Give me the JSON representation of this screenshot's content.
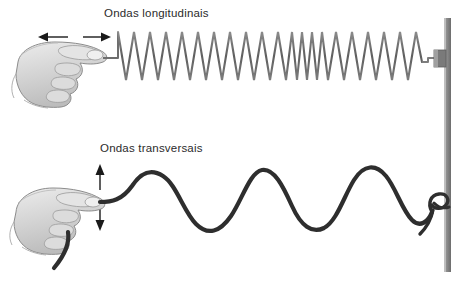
{
  "figure": {
    "title_longitudinal": "Ondas longitudinais",
    "title_transversal": "Ondas transversais",
    "background_color": "#ffffff",
    "text_color": "#2b2b2b",
    "spring_color": "#6e6e6e",
    "rope_color": "#2e2e2e",
    "post_color": "#8a8a8a",
    "arrow_color": "#1a1a1a",
    "hand_fill": "#d8d8d8",
    "hand_outline": "#8c8c8c"
  },
  "panels": {
    "longitudinal": {
      "label": "Ondas longitudinais",
      "motion_arrow": "horizontal-double-arrow",
      "medium": "spring",
      "coil_count": 22,
      "compression_zone": {
        "start_x": 292,
        "end_x": 322,
        "coils": 7
      },
      "anchor": "wall-bracket"
    },
    "transversal": {
      "label": "Ondas transversais",
      "motion_arrow": "vertical-double-arrow",
      "medium": "rope",
      "wave_count": 3,
      "crest_y": 170,
      "trough_y": 226,
      "anchor": "post-knot"
    }
  },
  "icons": {
    "hand_top": "hand-gripping-icon",
    "hand_bottom": "hand-gripping-icon",
    "arrow_horizontal": "double-arrow-horizontal-icon",
    "arrow_vertical": "double-arrow-vertical-icon",
    "knot": "rope-knot-icon",
    "bracket": "wall-bracket-icon"
  }
}
